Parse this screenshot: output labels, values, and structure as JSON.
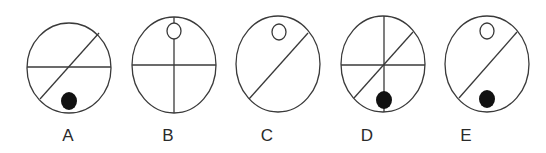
{
  "diagram": {
    "type": "multiple-choice-figure-options",
    "options": [
      {
        "label": "A",
        "ellipse": {
          "cx": 69,
          "cy": 68,
          "rx": 42,
          "ry": 45
        },
        "lines": [
          {
            "kind": "horizontal",
            "x1": 27,
            "y1": 67,
            "x2": 111,
            "y2": 67
          },
          {
            "kind": "diagonal",
            "x1": 40,
            "y1": 99,
            "x2": 99,
            "y2": 33
          }
        ],
        "open_circle": null,
        "filled_dot": {
          "cx": 69,
          "cy": 101,
          "rx": 8,
          "ry": 9
        }
      },
      {
        "label": "B",
        "ellipse": {
          "cx": 174,
          "cy": 65,
          "rx": 42,
          "ry": 48
        },
        "lines": [
          {
            "kind": "horizontal",
            "x1": 132,
            "y1": 65,
            "x2": 216,
            "y2": 65
          },
          {
            "kind": "vertical",
            "x1": 174,
            "y1": 17,
            "x2": 174,
            "y2": 113
          }
        ],
        "open_circle": {
          "cx": 174,
          "cy": 31,
          "rx": 7,
          "ry": 8
        },
        "filled_dot": null
      },
      {
        "label": "C",
        "ellipse": {
          "cx": 278,
          "cy": 64,
          "rx": 42,
          "ry": 48
        },
        "lines": [
          {
            "kind": "diagonal",
            "x1": 249,
            "y1": 99,
            "x2": 308,
            "y2": 33
          }
        ],
        "open_circle": {
          "cx": 279,
          "cy": 32,
          "rx": 7,
          "ry": 8
        },
        "filled_dot": null
      },
      {
        "label": "D",
        "ellipse": {
          "cx": 383,
          "cy": 64,
          "rx": 42,
          "ry": 48
        },
        "lines": [
          {
            "kind": "horizontal",
            "x1": 341,
            "y1": 65,
            "x2": 425,
            "y2": 65
          },
          {
            "kind": "vertical",
            "x1": 384,
            "y1": 16,
            "x2": 384,
            "y2": 112
          },
          {
            "kind": "diagonal",
            "x1": 354,
            "y1": 98,
            "x2": 413,
            "y2": 32
          }
        ],
        "open_circle": null,
        "filled_dot": {
          "cx": 384,
          "cy": 100,
          "rx": 8,
          "ry": 9
        }
      },
      {
        "label": "E",
        "ellipse": {
          "cx": 487,
          "cy": 64,
          "rx": 42,
          "ry": 48
        },
        "lines": [
          {
            "kind": "diagonal",
            "x1": 459,
            "y1": 98,
            "x2": 517,
            "y2": 32
          }
        ],
        "open_circle": {
          "cx": 487,
          "cy": 31,
          "rx": 7,
          "ry": 8
        },
        "filled_dot": {
          "cx": 487,
          "cy": 99,
          "rx": 8,
          "ry": 9
        }
      }
    ],
    "label_y": 141,
    "label_x": [
      68,
      168,
      267,
      367,
      466
    ],
    "colors": {
      "stroke": "#3a3a3a",
      "dot": "#111111",
      "background": "#ffffff",
      "label": "#2a2a2a"
    }
  }
}
